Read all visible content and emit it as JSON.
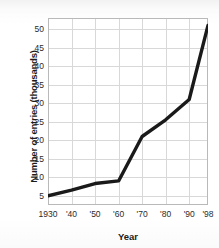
{
  "chart_data": {
    "type": "line",
    "title": "",
    "xlabel": "Year",
    "ylabel": "Number of entries (thousands)",
    "x": [
      1930,
      1940,
      1950,
      1960,
      1970,
      1980,
      1990,
      1998
    ],
    "xtick_labels": [
      "1930",
      "'40",
      "'50",
      "'60",
      "'70",
      "'80",
      "'90",
      "'98"
    ],
    "values": [
      5,
      6.5,
      8.3,
      9,
      21,
      25.5,
      31,
      51
    ],
    "ytick_labels": [
      "50",
      "45",
      "40",
      "35",
      "30",
      "25",
      "20",
      "15",
      "10",
      "5"
    ],
    "yticks": [
      50,
      45,
      40,
      35,
      30,
      25,
      20,
      15,
      10,
      5
    ],
    "ylim": [
      2.5,
      53
    ],
    "xlim": [
      1930,
      1998
    ],
    "grid": true,
    "legend": "none",
    "series_name": "Number of entries",
    "line_color": "#1a1a1a",
    "grid_color": "#d8d8d8",
    "frame_color": "#b9b9b9"
  }
}
